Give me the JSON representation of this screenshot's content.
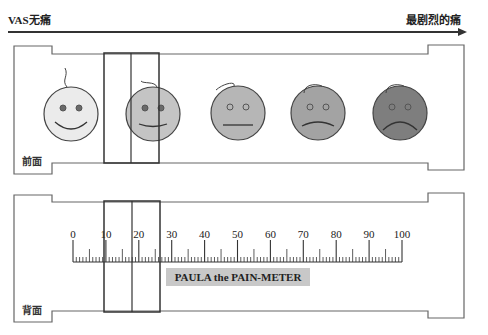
{
  "header": {
    "left_label": "VAS无痛",
    "right_label": "最剧烈的痛"
  },
  "front": {
    "side_label": "前面",
    "faces": [
      {
        "name": "smile-big",
        "fill": "#ebebeb",
        "mouth": "smile"
      },
      {
        "name": "smile-slight",
        "fill": "#c4c4c4",
        "mouth": "slight-smile"
      },
      {
        "name": "neutral",
        "fill": "#b6b6b6",
        "mouth": "flat"
      },
      {
        "name": "frown-slight",
        "fill": "#a3a3a3",
        "mouth": "slight-frown"
      },
      {
        "name": "frown-big",
        "fill": "#7e7e7e",
        "mouth": "frown"
      }
    ]
  },
  "back": {
    "side_label": "背面",
    "scale": {
      "min": 0,
      "max": 100,
      "major_step": 10,
      "labels": [
        "0",
        "10",
        "20",
        "30",
        "40",
        "50",
        "60",
        "70",
        "80",
        "90",
        "100"
      ]
    },
    "meter_label": "PAULA the PAIN-METER"
  },
  "slider": {
    "position_value": 18,
    "range": [
      10,
      26
    ]
  },
  "colors": {
    "line": "#555555",
    "slider": "#333333",
    "meter_label_bg": "#c8c8c8"
  }
}
